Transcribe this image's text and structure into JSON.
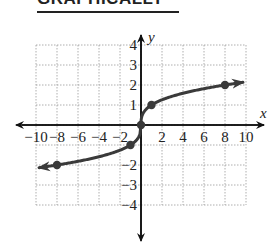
{
  "header": {
    "title": "GRAPHICALLY"
  },
  "chart_data": {
    "type": "line",
    "title": "",
    "function": "y = cube root of x",
    "xlabel": "x",
    "ylabel": "y",
    "xlim": [
      -10,
      10
    ],
    "ylim": [
      -4,
      4
    ],
    "grid": true,
    "x_ticks": [
      "-10",
      "-8",
      "-6",
      "-4",
      "-2",
      "2",
      "4",
      "6",
      "8",
      "10"
    ],
    "y_ticks": [
      "4",
      "3",
      "2",
      "1",
      "-2",
      "-3",
      "-4"
    ],
    "series": [
      {
        "name": "cube root",
        "marked_points": [
          {
            "x": -8,
            "y": -2
          },
          {
            "x": -1,
            "y": -1
          },
          {
            "x": 0,
            "y": 0
          },
          {
            "x": 1,
            "y": 1
          },
          {
            "x": 8,
            "y": 2
          }
        ],
        "arrows_at_ends": true
      }
    ],
    "colors": {
      "curve": "#3a3a3a",
      "axis": "#111111",
      "grid": "#9a9a9a"
    }
  }
}
